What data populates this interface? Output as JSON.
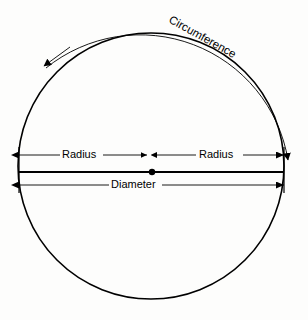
{
  "figure": {
    "type": "geometry-diagram",
    "background_color": "#fdfdfc",
    "stroke_color": "#000000"
  },
  "labels": {
    "circumference": "Circumference",
    "radius_left": "Radius",
    "radius_right": "Radius",
    "diameter": "Diameter"
  },
  "geometry": {
    "circle": {
      "center_x": 151,
      "center_y": 166,
      "radius": 133,
      "stroke_width": 1.6
    },
    "center_point": {
      "x": 152,
      "y": 172,
      "radius": 3
    },
    "diameter_chord": {
      "x1": 19,
      "x2": 284,
      "y": 172,
      "stroke_width": 2.1
    },
    "radius_row_y": 155,
    "diameter_row_y": 185,
    "left_edge_x": 19,
    "right_edge_x": 284,
    "center_split_x": 152,
    "arc": {
      "start_x": 44,
      "start_y": 66,
      "end_x": 290,
      "end_y": 168,
      "arrow_start": "down-left",
      "arrow_end": "down"
    },
    "circumference_text": {
      "x": 168,
      "y": 22,
      "rotation_deg": 29
    }
  }
}
